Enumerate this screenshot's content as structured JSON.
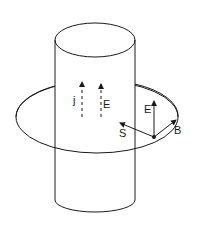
{
  "figure": {
    "labels": {
      "current_density": "j",
      "field_inside": "E",
      "field_surface": "E",
      "poynting": "S",
      "magnetic": "B"
    },
    "colors": {
      "ink": "#1a1a1a",
      "background": "#ffffff"
    }
  }
}
